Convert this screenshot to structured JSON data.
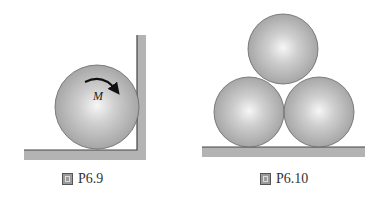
{
  "figures": [
    {
      "id": "left",
      "caption_prefix": "圖",
      "caption_label": "P6.9",
      "moment_label": "M",
      "spheres": [
        {
          "cx": 97,
          "cy": 107,
          "r": 42
        }
      ],
      "floor": {
        "x": 24,
        "y": 150,
        "w": 122,
        "h": 10
      },
      "wall": {
        "x": 137,
        "y": 35,
        "w": 9,
        "h": 125
      }
    },
    {
      "id": "right",
      "caption_prefix": "圖",
      "caption_label": "P6.10",
      "spheres": [
        {
          "cx": 283,
          "cy": 49,
          "r": 35
        },
        {
          "cx": 249,
          "cy": 112,
          "r": 35
        },
        {
          "cx": 319,
          "cy": 112,
          "r": 35
        }
      ],
      "floor": {
        "x": 202,
        "y": 147,
        "w": 163,
        "h": 10
      }
    }
  ],
  "colors": {
    "sphere_highlight": "#f4f4f4",
    "sphere_mid": "#b8b8b8",
    "sphere_edge": "#8a8a8a",
    "outline": "#555555",
    "surface_fill": "#b3b3b3",
    "surface_edge": "#444444"
  }
}
